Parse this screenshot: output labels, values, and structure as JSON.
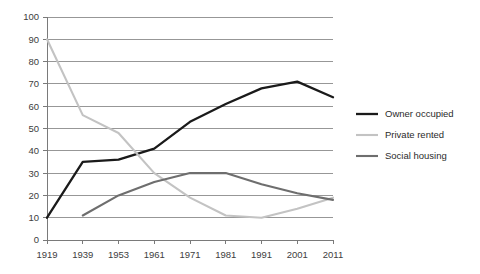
{
  "chart_data": {
    "type": "line",
    "title": "",
    "subtitle": "",
    "xlabel": "",
    "ylabel": "",
    "categories": [
      "1919",
      "1939",
      "1953",
      "1961",
      "1971",
      "1981",
      "1991",
      "2001",
      "2011"
    ],
    "ylim": [
      0,
      100
    ],
    "y_ticks": [
      "0",
      "10",
      "20",
      "30",
      "40",
      "50",
      "60",
      "70",
      "80",
      "90",
      "100"
    ],
    "grid": true,
    "legend_position": "right",
    "series": [
      {
        "name": "Owner occupied",
        "color": "#1a1a1a",
        "values": [
          10,
          35,
          36,
          41,
          53,
          61,
          68,
          71,
          64
        ]
      },
      {
        "name": "Private rented",
        "color": "#c3c3c3",
        "values": [
          90,
          56,
          48,
          30,
          19,
          11,
          10,
          14,
          19
        ]
      },
      {
        "name": "Social housing",
        "color": "#6e6e6e",
        "values": [
          null,
          11,
          20,
          26,
          30,
          30,
          25,
          21,
          18
        ]
      }
    ]
  },
  "legend": {
    "items": [
      {
        "label": "Owner occupied"
      },
      {
        "label": "Private rented"
      },
      {
        "label": "Social housing"
      }
    ]
  }
}
